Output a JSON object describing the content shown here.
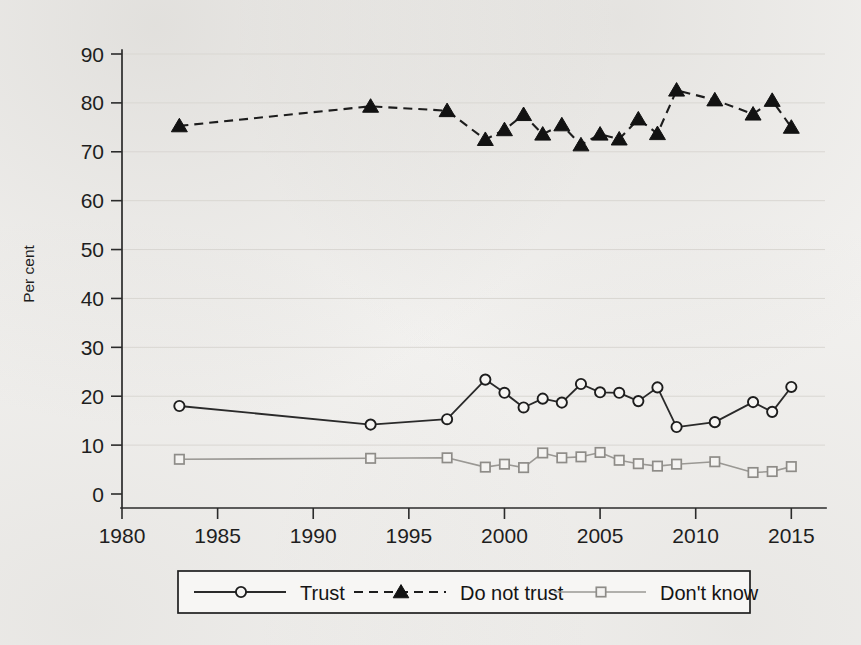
{
  "chart_data": {
    "type": "line",
    "title": "",
    "xlabel": "",
    "ylabel": "Per cent",
    "xlim": [
      1980,
      2016.5
    ],
    "ylim": [
      0,
      90
    ],
    "xticks": [
      1980,
      1985,
      1990,
      1995,
      2000,
      2005,
      2010,
      2015
    ],
    "yticks": [
      0,
      10,
      20,
      30,
      40,
      50,
      60,
      70,
      80,
      90
    ],
    "grid": true,
    "grid_axis": "y",
    "legend_position": "bottom",
    "series": [
      {
        "name": "Trust",
        "marker": "open-circle",
        "linestyle": "solid",
        "color": "#2a2a2a",
        "x": [
          1983,
          1993,
          1997,
          1999,
          2000,
          2001,
          2002,
          2003,
          2004,
          2005,
          2006,
          2007,
          2008,
          2009,
          2011,
          2013,
          2014,
          2015
        ],
        "values": [
          18.0,
          14.2,
          15.3,
          23.4,
          20.7,
          17.7,
          19.5,
          18.7,
          22.5,
          20.8,
          20.7,
          19.0,
          21.8,
          13.7,
          14.7,
          18.8,
          16.8,
          21.9
        ]
      },
      {
        "name": "Do not trust",
        "marker": "filled-triangle",
        "linestyle": "dashed",
        "color": "#121212",
        "x": [
          1983,
          1993,
          1997,
          1999,
          2000,
          2001,
          2002,
          2003,
          2004,
          2005,
          2006,
          2007,
          2008,
          2009,
          2011,
          2013,
          2014,
          2015
        ],
        "values": [
          75.3,
          79.3,
          78.4,
          72.5,
          74.5,
          77.6,
          73.6,
          75.5,
          71.4,
          73.6,
          72.6,
          76.7,
          73.7,
          82.6,
          80.6,
          77.7,
          80.5,
          75.0
        ]
      },
      {
        "name": "Don't know",
        "marker": "open-square",
        "linestyle": "solid",
        "color": "#9a9894",
        "x": [
          1983,
          1993,
          1997,
          1999,
          2000,
          2001,
          2002,
          2003,
          2004,
          2005,
          2006,
          2007,
          2008,
          2009,
          2011,
          2013,
          2014,
          2015
        ],
        "values": [
          7.1,
          7.3,
          7.4,
          5.5,
          6.1,
          5.4,
          8.4,
          7.4,
          7.6,
          8.5,
          6.9,
          6.2,
          5.7,
          6.1,
          6.6,
          4.4,
          4.6,
          5.6
        ]
      }
    ]
  },
  "axis": {
    "y_title": "Per cent",
    "y_tick_labels": [
      "90",
      "80",
      "70",
      "60",
      "50",
      "40",
      "30",
      "20",
      "10",
      "0"
    ],
    "x_tick_labels": [
      "1980",
      "1985",
      "1990",
      "1995",
      "2000",
      "2005",
      "2010",
      "2015"
    ]
  },
  "legend": {
    "items": [
      {
        "label": "Trust",
        "marker": "open-circle",
        "style": "solid",
        "color": "#2a2a2a"
      },
      {
        "label": "Do not trust",
        "marker": "filled-triangle",
        "style": "dashed",
        "color": "#121212"
      },
      {
        "label": "Don't know",
        "marker": "open-square",
        "style": "solid",
        "color": "#9a9894"
      }
    ]
  }
}
